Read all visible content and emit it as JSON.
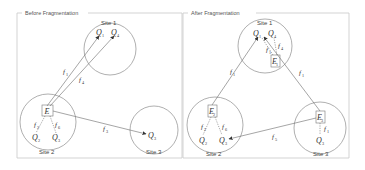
{
  "panels": [
    {
      "id": "before",
      "title": "Before Fragmentation",
      "sites": [
        {
          "label": "Site 1",
          "queries": [
            {
              "sym": "Q",
              "sub": "1"
            },
            {
              "sym": "Q",
              "sub": "4"
            }
          ]
        },
        {
          "label": "Site 2",
          "entity": {
            "sym": "E",
            "sub": ""
          },
          "queries": [
            {
              "sym": "Q",
              "sub": "2"
            },
            {
              "sym": "Q",
              "sub": "3"
            }
          ]
        },
        {
          "label": "Site 3",
          "queries": [
            {
              "sym": "Q",
              "sub": "3"
            }
          ]
        }
      ],
      "flows": [
        {
          "sym": "f",
          "sub": "1"
        },
        {
          "sym": "f",
          "sub": "4"
        },
        {
          "sym": "f",
          "sub": "2"
        },
        {
          "sym": "f",
          "sub": "6"
        },
        {
          "sym": "f",
          "sub": "3"
        }
      ]
    },
    {
      "id": "after",
      "title": "After Fragmentation",
      "sites": [
        {
          "label": "Site 1",
          "entity": {
            "sym": "E",
            "sub": "1"
          },
          "queries": [
            {
              "sym": "Q",
              "sub": "1"
            },
            {
              "sym": "Q",
              "sub": "4"
            }
          ]
        },
        {
          "label": "Site 2",
          "entity": {
            "sym": "E",
            "sub": "2"
          },
          "queries": [
            {
              "sym": "Q",
              "sub": "2"
            },
            {
              "sym": "Q",
              "sub": "3"
            }
          ]
        },
        {
          "label": "Site 3",
          "entity": {
            "sym": "E",
            "sub": "3"
          },
          "queries": [
            {
              "sym": "Q",
              "sub": "3"
            }
          ]
        }
      ],
      "flows": [
        {
          "sym": "f",
          "sub": "1"
        },
        {
          "sym": "f",
          "sub": "4"
        },
        {
          "sym": "f",
          "sub": "1"
        },
        {
          "sym": "f",
          "sub": "1"
        },
        {
          "sym": "f",
          "sub": "2"
        },
        {
          "sym": "f",
          "sub": "6"
        },
        {
          "sym": "f",
          "sub": "5"
        },
        {
          "sym": "f",
          "sub": "1"
        }
      ]
    }
  ]
}
